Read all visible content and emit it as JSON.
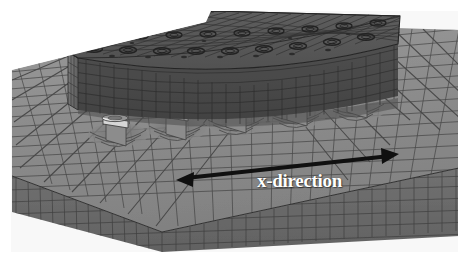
{
  "figure": {
    "background_color": "#ffffff",
    "width": 469,
    "height": 265
  },
  "annotations": {
    "axis_arrow": {
      "label": "x-direction",
      "label_color": "#ffffff",
      "arrow_color": "#101010",
      "style": "double-headed",
      "start": [
        178,
        179
      ],
      "end": [
        397,
        155
      ],
      "label_position": [
        257,
        170
      ]
    }
  },
  "model": {
    "parts": [
      {
        "name": "base-plate",
        "description": "Large meshed base plate / substrate block",
        "top_face_color": "#8f8f8f",
        "front_face_color": "#6b6b6b",
        "mesh_line_color": "#303030"
      },
      {
        "name": "upper-bracket-bar",
        "description": "Upper meshed rectangular bar with two rows of bolt hole rings",
        "top_face_color": "#5a5a5a",
        "front_face_color": "#4a4a4a",
        "end_face_color": "#6e6e6e",
        "mesh_line_color": "#262626",
        "bolt_hole_rows": 2,
        "bolt_holes_per_row": 9
      },
      {
        "name": "bolt-studs",
        "description": "Row of cylindrical bolt studs with bright washer heads clamping bracket to plate",
        "count": 5,
        "body_color": "#9a9a9a",
        "washer_color": "#e0e0e0",
        "shadow_color": "#4f4f4f"
      },
      {
        "name": "contact-dimples",
        "description": "Deformed contact depressions in plate surface beneath each bolt",
        "count": 5,
        "color": "#7a7a7a"
      }
    ]
  },
  "colors": {
    "background": "#ffffff",
    "plate_top": "#8f8f8f",
    "plate_front": "#6b6b6b",
    "bracket_top": "#565656",
    "bracket_front": "#474747",
    "mesh_line": "#2b2b2b",
    "arrow": "#101010",
    "label_text": "#ffffff"
  }
}
